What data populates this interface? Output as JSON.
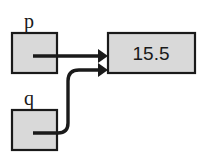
{
  "diagram": {
    "type": "pointer-aliasing-diagram",
    "variables": [
      {
        "name": "p",
        "label": "p",
        "box": {
          "x": 12,
          "y": 33,
          "width": 45,
          "height": 40
        },
        "label_pos": {
          "x": 29,
          "y": 28
        },
        "arrow_style": "straight"
      },
      {
        "name": "q",
        "label": "q",
        "box": {
          "x": 12,
          "y": 110,
          "width": 45,
          "height": 40
        },
        "label_pos": {
          "x": 29,
          "y": 105
        },
        "arrow_style": "curved"
      }
    ],
    "value_box": {
      "value": "15.5",
      "box": {
        "x": 108,
        "y": 33,
        "width": 87,
        "height": 40
      },
      "text_pos": {
        "x": 151,
        "y": 60
      }
    },
    "colors": {
      "box_fill": "#d9d9d9",
      "box_stroke": "#1a1a1a",
      "arrow": "#1a1a1a",
      "background": "#ffffff",
      "text": "#1a1a1a"
    }
  }
}
